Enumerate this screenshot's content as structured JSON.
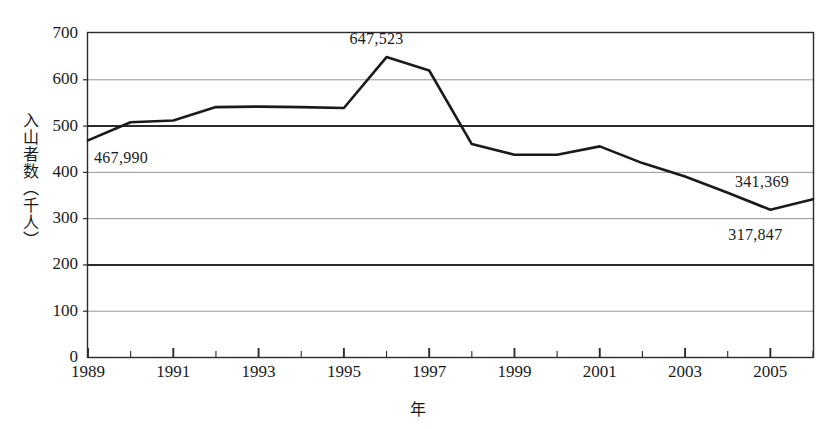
{
  "figure": {
    "scan_artifact_text": "",
    "width": 836,
    "height": 429
  },
  "chart_data": {
    "type": "line",
    "title": "",
    "xlabel": "年",
    "ylabel": "入山者数（千人）",
    "xlim": [
      1989,
      2006
    ],
    "ylim": [
      0,
      700
    ],
    "grid": true,
    "legend": "none",
    "line_color": "#1a1a1a",
    "x": [
      1989,
      1990,
      1991,
      1992,
      1993,
      1994,
      1995,
      1996,
      1997,
      1998,
      1999,
      2000,
      2001,
      2002,
      2003,
      2004,
      2005,
      2006
    ],
    "values": [
      468,
      507,
      511,
      540,
      541,
      540,
      538,
      648,
      619,
      460,
      437,
      437,
      455,
      419,
      390,
      355,
      318,
      341
    ],
    "series": [
      {
        "name": "入山者数",
        "values": [
          468,
          507,
          511,
          540,
          541,
          540,
          538,
          648,
          619,
          460,
          437,
          437,
          455,
          419,
          390,
          355,
          318,
          341
        ]
      }
    ],
    "y_ticks": [
      0,
      100,
      200,
      300,
      400,
      500,
      600,
      700
    ],
    "y_tick_labels": [
      "0",
      "100",
      "200",
      "300",
      "400",
      "500",
      "600",
      "700"
    ],
    "emphasized_gridlines": [
      200,
      500
    ],
    "x_ticks": [
      1989,
      1990,
      1991,
      1992,
      1993,
      1994,
      1995,
      1996,
      1997,
      1998,
      1999,
      2000,
      2001,
      2002,
      2003,
      2004,
      2005,
      2006
    ],
    "x_tick_labels": [
      "1989",
      "1991",
      "1993",
      "1995",
      "1997",
      "1999",
      "2001",
      "2003",
      "2005"
    ],
    "x_tick_label_years": [
      1989,
      1991,
      1993,
      1995,
      1997,
      1999,
      2001,
      2003,
      2005
    ],
    "annotations": [
      {
        "text": "467,990",
        "year": 1989,
        "value": 468,
        "anchor": "below-right"
      },
      {
        "text": "647,523",
        "year": 1996,
        "value": 648,
        "anchor": "above"
      },
      {
        "text": "341,369",
        "year": 2006,
        "value": 341,
        "anchor": "above-left"
      },
      {
        "text": "317,847",
        "year": 2005,
        "value": 318,
        "anchor": "below"
      }
    ]
  }
}
